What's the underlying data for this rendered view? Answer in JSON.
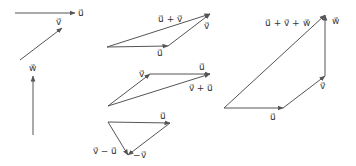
{
  "diagram": {
    "stroke_color": "#555555",
    "label_color": "#333333",
    "figures": [
      {
        "id": "basis",
        "arrows": [
          {
            "name": "u",
            "from": [
              15,
              13
            ],
            "to": [
              75,
              13
            ],
            "label": "u⃗",
            "label_pos": [
              78,
              16
            ]
          },
          {
            "name": "v",
            "from": [
              20,
              60
            ],
            "to": [
              62,
              28
            ],
            "label": "v⃗",
            "label_pos": [
              56,
              25
            ]
          },
          {
            "name": "w",
            "from": [
              33,
              135
            ],
            "to": [
              33,
              76
            ],
            "label": "w⃗",
            "label_pos": [
              29,
              71
            ]
          }
        ]
      },
      {
        "id": "u-plus-v",
        "arrows": [
          {
            "name": "u",
            "from": [
              107,
              47
            ],
            "to": [
              168,
              46
            ],
            "label": "u⃗",
            "label_pos": [
              157,
              56
            ]
          },
          {
            "name": "v",
            "from": [
              168,
              46
            ],
            "to": [
              210,
              14
            ],
            "label": "v⃗",
            "label_pos": [
              204,
              29
            ]
          },
          {
            "name": "u+v",
            "from": [
              107,
              47
            ],
            "to": [
              210,
              14
            ],
            "label": "u⃗ + v⃗",
            "label_pos": [
              158,
              22
            ]
          }
        ]
      },
      {
        "id": "v-plus-u",
        "arrows": [
          {
            "name": "v",
            "from": [
              108,
              106
            ],
            "to": [
              150,
              74
            ],
            "label": "v⃗",
            "label_pos": [
              139,
              77
            ]
          },
          {
            "name": "u",
            "from": [
              150,
              74
            ],
            "to": [
              210,
              74
            ],
            "label": "u⃗",
            "label_pos": [
              199,
              70
            ]
          },
          {
            "name": "v+u",
            "from": [
              108,
              106
            ],
            "to": [
              210,
              74
            ],
            "label": "v⃗ + u⃗",
            "label_pos": [
              189,
              91
            ]
          }
        ]
      },
      {
        "id": "v-minus-u",
        "arrows": [
          {
            "name": "u",
            "from": [
              108,
              122
            ],
            "to": [
              170,
              123
            ],
            "label": "u⃗",
            "label_pos": [
              160,
              119
            ]
          },
          {
            "name": "-v",
            "from": [
              170,
              123
            ],
            "to": [
              128,
              155
            ],
            "label": "−v⃗",
            "label_pos": [
              133,
              158
            ]
          },
          {
            "name": "v-u",
            "from": [
              108,
              122
            ],
            "to": [
              128,
              155
            ],
            "label": "v⃗ − u⃗",
            "label_pos": [
              93,
              154
            ]
          }
        ]
      },
      {
        "id": "u-plus-v-plus-w",
        "arrows": [
          {
            "name": "u",
            "from": [
              224,
              108
            ],
            "to": [
              283,
              108
            ],
            "label": "u⃗",
            "label_pos": [
              270,
              120
            ]
          },
          {
            "name": "v",
            "from": [
              283,
              108
            ],
            "to": [
              325,
              76
            ],
            "label": "v⃗",
            "label_pos": [
              320,
              89
            ]
          },
          {
            "name": "w",
            "from": [
              325,
              76
            ],
            "to": [
              325,
              15
            ],
            "label": "w⃗",
            "label_pos": [
              332,
              24
            ]
          },
          {
            "name": "u+v+w",
            "from": [
              224,
              108
            ],
            "to": [
              325,
              15
            ],
            "label": "u⃗ + v⃗ + w⃗",
            "label_pos": [
              265,
              26
            ]
          }
        ]
      }
    ]
  }
}
